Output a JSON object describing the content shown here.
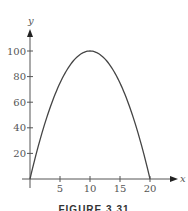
{
  "chart_data": {
    "type": "line",
    "title": "",
    "xlabel": "x",
    "ylabel": "y",
    "xlim": [
      0,
      20
    ],
    "ylim": [
      0,
      100
    ],
    "x_ticks": [
      5,
      10,
      15,
      20
    ],
    "y_ticks": [
      20,
      40,
      60,
      80,
      100
    ],
    "grid": false,
    "legend": null,
    "series": [
      {
        "name": "y = 20x - x^2",
        "x": [
          0,
          2,
          4,
          6,
          8,
          10,
          12,
          14,
          16,
          18,
          20
        ],
        "values": [
          0,
          36,
          64,
          84,
          96,
          100,
          96,
          84,
          64,
          36,
          0
        ]
      }
    ],
    "caption": "FIGURE 3.31"
  },
  "colors": {
    "axis": "#555555",
    "curve": "#444444",
    "text": "#555555"
  }
}
